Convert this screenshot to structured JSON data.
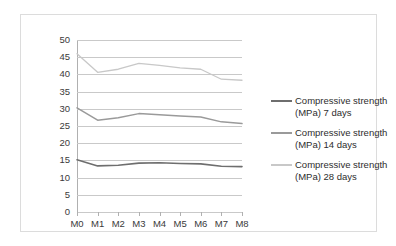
{
  "chart_data": {
    "type": "line",
    "title": "",
    "xlabel": "",
    "ylabel": "",
    "categories": [
      "M0",
      "M1",
      "M2",
      "M3",
      "M4",
      "M5",
      "M6",
      "M7",
      "M8"
    ],
    "ylim": [
      0,
      50
    ],
    "ytick_step": 5,
    "yticks": [
      50,
      45,
      40,
      35,
      30,
      25,
      20,
      15,
      10,
      5,
      0
    ],
    "grid": true,
    "legend_position": "right",
    "series": [
      {
        "name": "Compressive strength (MPa) 7 days",
        "color": "#6e6e6e",
        "values": [
          15.2,
          13.4,
          13.6,
          14.2,
          14.3,
          14.1,
          14.0,
          13.3,
          13.2
        ]
      },
      {
        "name": "Compressive strength (MPa) 14 days",
        "color": "#9a9a9a",
        "values": [
          30.3,
          26.7,
          27.4,
          28.6,
          28.3,
          27.9,
          27.6,
          26.2,
          25.7
        ]
      },
      {
        "name": "Compressive strength (MPa) 28 days",
        "color": "#c8c8c8",
        "values": [
          46.0,
          40.6,
          41.5,
          43.2,
          42.6,
          41.9,
          41.5,
          38.6,
          38.3
        ]
      }
    ]
  },
  "legend": {
    "items": [
      {
        "line1": "Compressive strength",
        "line2": "(MPa) 7 days"
      },
      {
        "line1": "Compressive strength",
        "line2": "(MPa) 14 days"
      },
      {
        "line1": "Compressive strength",
        "line2": "(MPa) 28 days"
      }
    ]
  }
}
